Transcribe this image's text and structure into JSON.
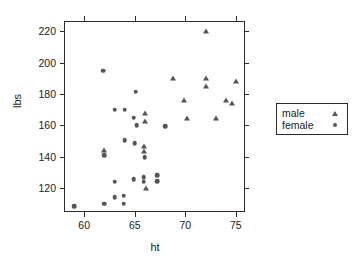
{
  "chart_data": {
    "type": "scatter",
    "title": "",
    "xlabel": "ht",
    "ylabel": "lbs",
    "xlim": [
      58.1,
      76.0
    ],
    "ylim": [
      104,
      226
    ],
    "xticks": [
      60,
      65,
      70,
      75
    ],
    "yticks": [
      120,
      140,
      160,
      180,
      200,
      220
    ],
    "grid": false,
    "legend_position": "right-outside",
    "series": [
      {
        "name": "male",
        "marker": "triangle",
        "color": "#555555",
        "points": [
          [
            72.0,
            220.0
          ],
          [
            68.8,
            190.0
          ],
          [
            72.0,
            190.0
          ],
          [
            75.0,
            188.5
          ],
          [
            72.0,
            185.0
          ],
          [
            69.9,
            176.0
          ],
          [
            74.0,
            176.0
          ],
          [
            74.6,
            174.5
          ],
          [
            70.2,
            165.0
          ],
          [
            73.0,
            164.5
          ],
          [
            66.0,
            168.0
          ],
          [
            66.0,
            163.0
          ],
          [
            62.0,
            144.0
          ],
          [
            65.9,
            147.0
          ],
          [
            65.9,
            143.5
          ],
          [
            66.1,
            120.0
          ]
        ]
      },
      {
        "name": "female",
        "marker": "circle",
        "color": "#555555",
        "points": [
          [
            61.9,
            195.0
          ],
          [
            65.1,
            181.5
          ],
          [
            63.0,
            170.0
          ],
          [
            64.0,
            170.0
          ],
          [
            64.9,
            165.0
          ],
          [
            65.2,
            160.0
          ],
          [
            68.0,
            159.5
          ],
          [
            64.0,
            150.5
          ],
          [
            65.0,
            148.5
          ],
          [
            66.0,
            139.5
          ],
          [
            62.0,
            141.0
          ],
          [
            63.0,
            124.0
          ],
          [
            64.9,
            125.5
          ],
          [
            65.9,
            127.0
          ],
          [
            65.9,
            124.0
          ],
          [
            67.2,
            128.0
          ],
          [
            67.2,
            124.5
          ],
          [
            59.0,
            108.5
          ],
          [
            62.0,
            110.0
          ],
          [
            63.9,
            115.0
          ],
          [
            63.9,
            110.0
          ],
          [
            63.0,
            114.0
          ]
        ]
      }
    ]
  },
  "legend": {
    "entries": [
      {
        "label": "male",
        "marker": "triangle"
      },
      {
        "label": "female",
        "marker": "circle"
      }
    ]
  }
}
